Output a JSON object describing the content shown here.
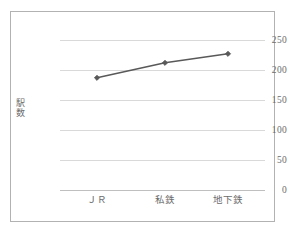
{
  "figure": {
    "background_color": "#ffffff",
    "frame_color": "#b2b2b2",
    "gridline_color": "#d9d9d9",
    "tick_label_color": "#6b6b6b",
    "series_color": "#595959"
  },
  "axis": {
    "y_title_chars": [
      "駅",
      "数"
    ],
    "y_ticks": [
      "0",
      "50",
      "100",
      "150",
      "200",
      "250"
    ],
    "x_ticks": [
      "ＪＲ",
      "私鉄",
      "地下鉄"
    ]
  },
  "chart_data": {
    "type": "line",
    "title": "",
    "xlabel": "",
    "ylabel": "駅数",
    "categories": [
      "ＪＲ",
      "私鉄",
      "地下鉄"
    ],
    "values": [
      187,
      212,
      227
    ],
    "series": [
      {
        "name": "駅数",
        "values": [
          187,
          212,
          227
        ],
        "color": "#595959",
        "marker": "diamond",
        "line_width": 1.6
      }
    ],
    "ylim": [
      0,
      250
    ],
    "y_ticks": [
      0,
      50,
      100,
      150,
      200,
      250
    ],
    "grid": true,
    "grid_axis": "y",
    "legend": false,
    "legend_position": "none"
  }
}
